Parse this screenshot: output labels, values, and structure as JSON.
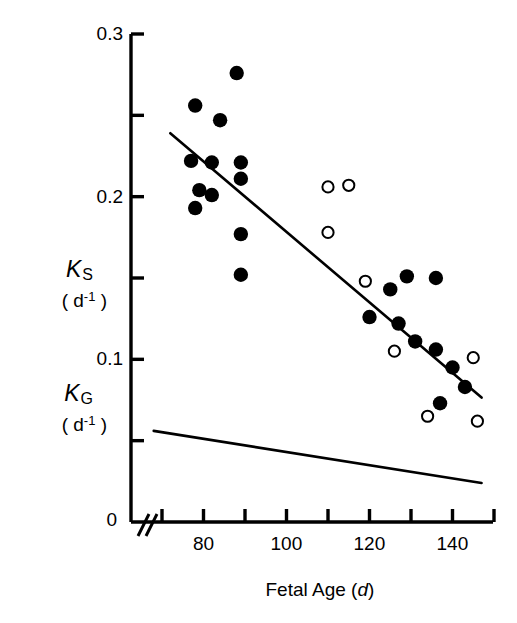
{
  "chart_data": {
    "type": "scatter",
    "title": "",
    "xlabel": "Fetal Age (d)",
    "ylabel_primary": "K S ( d -1 )",
    "ylabel_secondary": "K G ( d -1 )",
    "xlim": [
      68,
      152
    ],
    "ylim": [
      0,
      0.3
    ],
    "xticks": [
      70,
      80,
      90,
      100,
      110,
      120,
      130,
      140,
      150
    ],
    "xtick_labels": [
      "",
      "80",
      "",
      "100",
      "",
      "120",
      "",
      "140",
      ""
    ],
    "yticks": [
      0,
      0.05,
      0.1,
      0.15,
      0.2,
      0.25,
      0.3
    ],
    "ytick_labels": [
      "0",
      "",
      "0.1",
      "",
      "0.2",
      "",
      "0.3"
    ],
    "axis_break": true,
    "axis_break_symbol": "//",
    "grid": false,
    "legend": "none",
    "series": [
      {
        "name": "filled-circles",
        "marker": "filled-circle",
        "color": "#000000",
        "points": [
          {
            "x": 88,
            "y": 0.276
          },
          {
            "x": 78,
            "y": 0.256
          },
          {
            "x": 84,
            "y": 0.247
          },
          {
            "x": 77,
            "y": 0.222
          },
          {
            "x": 82,
            "y": 0.221
          },
          {
            "x": 89,
            "y": 0.221
          },
          {
            "x": 89,
            "y": 0.211
          },
          {
            "x": 79,
            "y": 0.204
          },
          {
            "x": 82,
            "y": 0.201
          },
          {
            "x": 78,
            "y": 0.193
          },
          {
            "x": 89,
            "y": 0.177
          },
          {
            "x": 89,
            "y": 0.152
          },
          {
            "x": 129,
            "y": 0.151
          },
          {
            "x": 136,
            "y": 0.15
          },
          {
            "x": 125,
            "y": 0.143
          },
          {
            "x": 120,
            "y": 0.126
          },
          {
            "x": 127,
            "y": 0.122
          },
          {
            "x": 131,
            "y": 0.111
          },
          {
            "x": 136,
            "y": 0.106
          },
          {
            "x": 140,
            "y": 0.095
          },
          {
            "x": 143,
            "y": 0.083
          },
          {
            "x": 137,
            "y": 0.073
          }
        ]
      },
      {
        "name": "open-circles",
        "marker": "open-circle",
        "color": "#000000",
        "points": [
          {
            "x": 110,
            "y": 0.206
          },
          {
            "x": 115,
            "y": 0.207
          },
          {
            "x": 110,
            "y": 0.178
          },
          {
            "x": 119,
            "y": 0.148
          },
          {
            "x": 126,
            "y": 0.105
          },
          {
            "x": 145,
            "y": 0.101
          },
          {
            "x": 134,
            "y": 0.065
          },
          {
            "x": 146,
            "y": 0.062
          }
        ]
      }
    ],
    "lines": [
      {
        "name": "ks-regression-line",
        "from": {
          "x": 72,
          "y": 0.239
        },
        "to": {
          "x": 147,
          "y": 0.0765
        }
      },
      {
        "name": "kg-regression-line",
        "from": {
          "x": 68,
          "y": 0.056
        },
        "to": {
          "x": 147,
          "y": 0.024
        }
      }
    ]
  },
  "axis": {
    "x_title_text": "Fetal Age (",
    "x_title_italic": "d",
    "x_title_close": ")",
    "y_zero_label": "0",
    "y_01_label": "0.1",
    "y_02_label": "0.2",
    "y_03_label": "0.3",
    "x_80": "80",
    "x_100": "100",
    "x_120": "120",
    "x_140": "140",
    "break_mark": "//"
  },
  "labels": {
    "ks_letter": "K",
    "ks_sub": "S",
    "kg_letter": "K",
    "kg_sub": "G",
    "unit_open": "( d",
    "unit_exp": "-1",
    "unit_close": " )"
  }
}
